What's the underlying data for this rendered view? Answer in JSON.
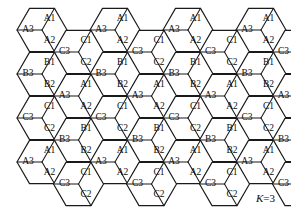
{
  "figure": {
    "annotation": {
      "symbol": "K",
      "equals": "=",
      "value": "3",
      "full_text": "K=3"
    },
    "colors": {
      "background": "#ffffff",
      "cell_stroke": "#1a1a1a",
      "cell_fill": "#ffffff",
      "label_text": "#0d0d0d"
    },
    "geometry": {
      "hex_radius": 25,
      "column_step_x": 73,
      "row_step_y": 44,
      "offset_column_dx": 36.5,
      "offset_column_dy": 22
    },
    "sector_labels": {
      "left": "3",
      "top_right": "1",
      "bottom_right": "2"
    },
    "cluster_groups": [
      "A",
      "B",
      "C"
    ],
    "cells": [
      {
        "group": "A",
        "cx": 42,
        "cy": 30,
        "labels": [
          "A3",
          "A1",
          "A2"
        ]
      },
      {
        "group": "A",
        "cx": 115,
        "cy": 30,
        "labels": [
          "A3",
          "A1",
          "A2"
        ]
      },
      {
        "group": "A",
        "cx": 188,
        "cy": 30,
        "labels": [
          "A3",
          "A1",
          "A2"
        ]
      },
      {
        "group": "A",
        "cx": 261,
        "cy": 30,
        "labels": [
          "A3",
          "A1",
          "A2"
        ]
      },
      {
        "group": "C",
        "cx": 78.5,
        "cy": 52,
        "labels": [
          "C3",
          "C1",
          "C2"
        ]
      },
      {
        "group": "C",
        "cx": 151.5,
        "cy": 52,
        "labels": [
          "C3",
          "C1",
          "C2"
        ]
      },
      {
        "group": "C",
        "cx": 224.5,
        "cy": 52,
        "labels": [
          "C3",
          "C1",
          "C2"
        ]
      },
      {
        "group": "C",
        "cx": 297.5,
        "cy": 52,
        "labels": [
          "C3",
          "C1",
          "C2"
        ]
      },
      {
        "group": "B",
        "cx": 42,
        "cy": 74,
        "labels": [
          "B3",
          "B1",
          "B2"
        ]
      },
      {
        "group": "B",
        "cx": 115,
        "cy": 74,
        "labels": [
          "B3",
          "B1",
          "B2"
        ]
      },
      {
        "group": "B",
        "cx": 188,
        "cy": 74,
        "labels": [
          "B3",
          "B1",
          "B2"
        ]
      },
      {
        "group": "B",
        "cx": 261,
        "cy": 74,
        "labels": [
          "B3",
          "B1",
          "B2"
        ]
      },
      {
        "group": "A",
        "cx": 78.5,
        "cy": 96,
        "labels": [
          "A3",
          "A1",
          "A2"
        ]
      },
      {
        "group": "A",
        "cx": 151.5,
        "cy": 96,
        "labels": [
          "A3",
          "A1",
          "A2"
        ]
      },
      {
        "group": "A",
        "cx": 224.5,
        "cy": 96,
        "labels": [
          "A3",
          "A1",
          "A2"
        ]
      },
      {
        "group": "A",
        "cx": 297.5,
        "cy": 96,
        "labels": [
          "A3",
          "A1",
          "A2"
        ]
      },
      {
        "group": "C",
        "cx": 42,
        "cy": 118,
        "labels": [
          "C3",
          "C1",
          "C2"
        ]
      },
      {
        "group": "C",
        "cx": 115,
        "cy": 118,
        "labels": [
          "C3",
          "C1",
          "C2"
        ]
      },
      {
        "group": "C",
        "cx": 188,
        "cy": 118,
        "labels": [
          "C3",
          "C1",
          "C2"
        ]
      },
      {
        "group": "C",
        "cx": 261,
        "cy": 118,
        "labels": [
          "C3",
          "C1",
          "C2"
        ]
      },
      {
        "group": "B",
        "cx": 78.5,
        "cy": 140,
        "labels": [
          "B3",
          "B1",
          "B2"
        ]
      },
      {
        "group": "B",
        "cx": 151.5,
        "cy": 140,
        "labels": [
          "B3",
          "B1",
          "B2"
        ]
      },
      {
        "group": "B",
        "cx": 224.5,
        "cy": 140,
        "labels": [
          "B3",
          "B1",
          "B2"
        ]
      },
      {
        "group": "B",
        "cx": 297.5,
        "cy": 140,
        "labels": [
          "B3",
          "B1",
          "B2"
        ]
      },
      {
        "group": "A",
        "cx": 42,
        "cy": 162,
        "labels": [
          "A3",
          "A1",
          "A2"
        ]
      },
      {
        "group": "A",
        "cx": 115,
        "cy": 162,
        "labels": [
          "A3",
          "A1",
          "A2"
        ]
      },
      {
        "group": "A",
        "cx": 188,
        "cy": 162,
        "labels": [
          "A3",
          "A1",
          "A2"
        ]
      },
      {
        "group": "A",
        "cx": 261,
        "cy": 162,
        "labels": [
          "A3",
          "A1",
          "A2"
        ]
      },
      {
        "group": "C",
        "cx": 78.5,
        "cy": 184,
        "labels": [
          "C3",
          "C1",
          "C2"
        ]
      },
      {
        "group": "C",
        "cx": 151.5,
        "cy": 184,
        "labels": [
          "C3",
          "C1",
          "C2"
        ]
      },
      {
        "group": "C",
        "cx": 224.5,
        "cy": 184,
        "labels": [
          "C3",
          "C1",
          "C2"
        ]
      },
      {
        "group": "C",
        "cx": 297.5,
        "cy": 184,
        "labels": [
          "C3",
          "C1",
          "C2"
        ]
      }
    ]
  }
}
